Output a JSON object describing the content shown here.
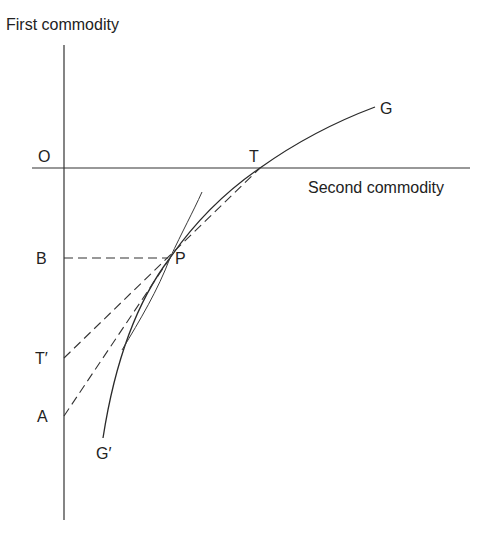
{
  "diagram": {
    "y_axis_label": "First commodity",
    "x_axis_label": "Second commodity",
    "points": {
      "origin": "O",
      "T": "T",
      "G": "G",
      "P": "P",
      "B": "B",
      "T_prime": "T′",
      "A": "A",
      "G_prime": "G′"
    },
    "elements": [
      {
        "name": "transformation-curve",
        "from": "G′",
        "to": "G",
        "through": [
          "P",
          "T"
        ]
      },
      {
        "name": "tangent-line-at-P",
        "from": "T′",
        "to": "T",
        "style": "dashed"
      },
      {
        "name": "line-A-to-P",
        "from": "A",
        "to": "P",
        "style": "dashed"
      },
      {
        "name": "horizontal-B-to-P",
        "from": "B",
        "to": "P",
        "style": "dashed"
      },
      {
        "name": "secondary-curve-through-P",
        "style": "solid-thin"
      }
    ]
  }
}
